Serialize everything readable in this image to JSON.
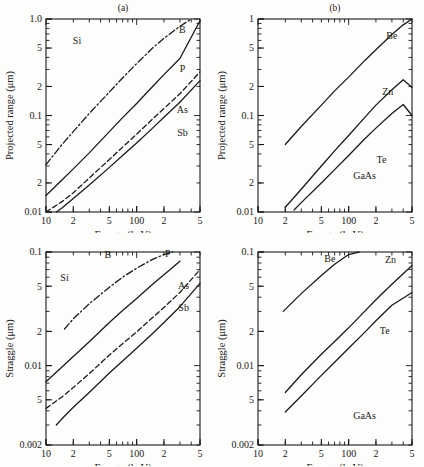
{
  "figure": {
    "name": "projected-range-and-straggle-vs-energy",
    "background": "#fdfdfb",
    "ink": "#1a1a1a"
  },
  "common": {
    "xlabel": "Energy (keV)",
    "x_tick_labels": [
      "10",
      "2",
      "5",
      "100",
      "2",
      "5"
    ],
    "x_tick_values": [
      10,
      20,
      50,
      100,
      200,
      500
    ],
    "xlim": [
      10,
      500
    ]
  },
  "panels": [
    {
      "id": "a",
      "caption": "(a)",
      "material": "Si",
      "ylabel": "Projected range (μm)",
      "y_tick_labels": [
        "1.0",
        "5",
        "2",
        "0.1",
        "5",
        "2",
        "0.01"
      ],
      "y_tick_values": [
        1.0,
        0.5,
        0.2,
        0.1,
        0.05,
        0.02,
        0.01
      ],
      "ylim": [
        0.01,
        1.0
      ],
      "curve_labels": [
        "B",
        "P",
        "As",
        "Sb"
      ]
    },
    {
      "id": "b",
      "caption": "(b)",
      "material": "GaAs",
      "ylabel": "Projected range (μm)",
      "y_tick_labels": [
        "1",
        "5",
        "2",
        "0.1",
        "5",
        "2",
        "0.01"
      ],
      "y_tick_values": [
        1.0,
        0.5,
        0.2,
        0.1,
        0.05,
        0.02,
        0.01
      ],
      "ylim": [
        0.01,
        1.0
      ],
      "curve_labels": [
        "Be",
        "Zn",
        "Te"
      ]
    },
    {
      "id": "c",
      "caption": "(c)",
      "material": "Si",
      "ylabel": "Straggle (μm)",
      "y_tick_labels": [
        "0.1",
        "5",
        "2",
        "0.01",
        "5",
        "0.002"
      ],
      "y_tick_values": [
        0.1,
        0.05,
        0.02,
        0.01,
        0.005,
        0.002
      ],
      "ylim": [
        0.002,
        0.1
      ],
      "curve_labels": [
        "B",
        "P",
        "As",
        "Sb"
      ]
    },
    {
      "id": "d",
      "caption": "(d)",
      "material": "GaAs",
      "ylabel": "Straggle (μm)",
      "y_tick_labels": [
        "0.1",
        "5",
        "2",
        "0.01",
        "5",
        "0.002"
      ],
      "y_tick_values": [
        0.1,
        0.05,
        0.02,
        0.01,
        0.005,
        0.002
      ],
      "ylim": [
        0.002,
        0.1
      ],
      "curve_labels": [
        "Be",
        "Zn",
        "Te"
      ]
    }
  ],
  "chart_data": [
    {
      "panel": "a",
      "type": "line",
      "title": "(a)",
      "xlabel": "Energy (keV)",
      "ylabel": "Projected range (μm)",
      "xlim": [
        10,
        500
      ],
      "ylim": [
        0.01,
        1.0
      ],
      "xscale": "log",
      "yscale": "log",
      "annotation": "Si",
      "grid": false,
      "legend": "inline-right-of-curve",
      "series": [
        {
          "name": "B",
          "style": "dash-dot",
          "label_x": 320,
          "label_y": 0.72,
          "x": [
            10,
            15,
            20,
            30,
            50,
            70,
            100,
            150,
            200,
            300,
            400
          ],
          "y": [
            0.031,
            0.05,
            0.068,
            0.105,
            0.175,
            0.245,
            0.345,
            0.5,
            0.63,
            0.84,
            1.0
          ]
        },
        {
          "name": "P",
          "style": "solid",
          "label_x": 320,
          "label_y": 0.28,
          "x": [
            10,
            15,
            20,
            30,
            50,
            70,
            100,
            150,
            200,
            300,
            500
          ],
          "y": [
            0.0148,
            0.0215,
            0.028,
            0.041,
            0.068,
            0.095,
            0.133,
            0.2,
            0.265,
            0.39,
            0.96
          ]
        },
        {
          "name": "As",
          "style": "dashed",
          "label_x": 320,
          "label_y": 0.105,
          "x": [
            10,
            15,
            20,
            30,
            50,
            70,
            100,
            150,
            200,
            300,
            500
          ],
          "y": [
            0.01,
            0.0128,
            0.0158,
            0.0225,
            0.035,
            0.047,
            0.064,
            0.092,
            0.118,
            0.168,
            0.283
          ]
        },
        {
          "name": "Sb",
          "style": "solid",
          "label_x": 320,
          "label_y": 0.062,
          "x": [
            13,
            15,
            20,
            30,
            50,
            70,
            100,
            150,
            200,
            300,
            500
          ],
          "y": [
            0.01,
            0.011,
            0.0138,
            0.019,
            0.029,
            0.0385,
            0.052,
            0.074,
            0.096,
            0.137,
            0.23
          ]
        }
      ]
    },
    {
      "panel": "b",
      "type": "line",
      "title": "(b)",
      "xlabel": "Energy (keV)",
      "ylabel": "Projected range (μm)",
      "xlim": [
        10,
        500
      ],
      "ylim": [
        0.01,
        1.0
      ],
      "xscale": "log",
      "yscale": "log",
      "annotation": "GaAs",
      "grid": false,
      "legend": "inline-right-of-curve",
      "series": [
        {
          "name": "Be",
          "style": "solid",
          "label_x": 300,
          "label_y": 0.62,
          "x": [
            20,
            30,
            50,
            70,
            100,
            150,
            200,
            300,
            400,
            500
          ],
          "y": [
            0.05,
            0.077,
            0.128,
            0.18,
            0.25,
            0.37,
            0.48,
            0.69,
            0.87,
            1.0
          ]
        },
        {
          "name": "Zn",
          "style": "solid",
          "label_x": 270,
          "label_y": 0.165,
          "x": [
            20,
            30,
            50,
            70,
            100,
            150,
            200,
            300,
            400,
            500
          ],
          "y": [
            0.0112,
            0.0172,
            0.03,
            0.043,
            0.062,
            0.095,
            0.128,
            0.185,
            0.235,
            0.195
          ]
        },
        {
          "name": "Te",
          "style": "solid",
          "label_x": 230,
          "label_y": 0.032,
          "x": [
            25,
            30,
            50,
            70,
            100,
            150,
            200,
            300,
            400,
            500
          ],
          "y": [
            0.0105,
            0.0125,
            0.02,
            0.0275,
            0.0385,
            0.057,
            0.074,
            0.105,
            0.13,
            0.1
          ]
        }
      ]
    },
    {
      "panel": "c",
      "type": "line",
      "title": "(c)",
      "xlabel": "Energy (keV)",
      "ylabel": "Straggle (μm)",
      "xlim": [
        10,
        500
      ],
      "ylim": [
        0.002,
        0.1
      ],
      "xscale": "log",
      "yscale": "log",
      "annotation": "Si",
      "grid": false,
      "legend": "inline-right-of-curve",
      "series": [
        {
          "name": "B",
          "style": "dash-dot",
          "label_x": 48,
          "label_y": 0.088,
          "x": [
            16,
            20,
            30,
            50,
            70,
            100,
            150,
            200,
            250
          ],
          "y": [
            0.021,
            0.0258,
            0.035,
            0.049,
            0.06,
            0.072,
            0.086,
            0.095,
            0.1
          ]
        },
        {
          "name": "P",
          "style": "solid",
          "label_x": 220,
          "label_y": 0.09,
          "x": [
            10,
            15,
            20,
            30,
            50,
            70,
            100,
            150,
            200,
            300
          ],
          "y": [
            0.0072,
            0.0097,
            0.012,
            0.0162,
            0.024,
            0.0305,
            0.039,
            0.052,
            0.063,
            0.083
          ]
        },
        {
          "name": "As",
          "style": "dashed",
          "label_x": 330,
          "label_y": 0.047,
          "x": [
            10,
            15,
            20,
            30,
            50,
            70,
            100,
            150,
            200,
            300,
            500
          ],
          "y": [
            0.0042,
            0.0053,
            0.0064,
            0.0085,
            0.0124,
            0.0156,
            0.0198,
            0.0265,
            0.0325,
            0.044,
            0.07
          ]
        },
        {
          "name": "Sb",
          "style": "solid",
          "label_x": 330,
          "label_y": 0.03,
          "x": [
            13,
            15,
            20,
            30,
            50,
            70,
            100,
            150,
            200,
            300,
            500
          ],
          "y": [
            0.003,
            0.0034,
            0.0043,
            0.0058,
            0.0086,
            0.011,
            0.0142,
            0.0192,
            0.024,
            0.033,
            0.053
          ]
        }
      ]
    },
    {
      "panel": "d",
      "type": "line",
      "title": "(d)",
      "xlabel": "Energy (keV)",
      "ylabel": "Straggle (μm)",
      "xlim": [
        10,
        500
      ],
      "ylim": [
        0.002,
        0.1
      ],
      "xscale": "log",
      "yscale": "log",
      "annotation": "GaAs",
      "grid": false,
      "legend": "inline-right-of-curve",
      "series": [
        {
          "name": "Be",
          "style": "solid",
          "label_x": 62,
          "label_y": 0.082,
          "x": [
            19,
            30,
            50,
            70,
            100,
            130
          ],
          "y": [
            0.03,
            0.043,
            0.062,
            0.078,
            0.095,
            0.1
          ]
        },
        {
          "name": "Zn",
          "style": "solid",
          "label_x": 290,
          "label_y": 0.08,
          "x": [
            20,
            30,
            50,
            70,
            100,
            150,
            200,
            300,
            500
          ],
          "y": [
            0.0058,
            0.0083,
            0.0126,
            0.0163,
            0.0215,
            0.03,
            0.038,
            0.052,
            0.076
          ]
        },
        {
          "name": "Te",
          "style": "solid",
          "label_x": 250,
          "label_y": 0.019,
          "x": [
            20,
            30,
            50,
            70,
            100,
            150,
            200,
            300,
            500
          ],
          "y": [
            0.0039,
            0.0054,
            0.0082,
            0.0107,
            0.0142,
            0.0196,
            0.0248,
            0.034,
            0.044
          ]
        }
      ]
    }
  ]
}
